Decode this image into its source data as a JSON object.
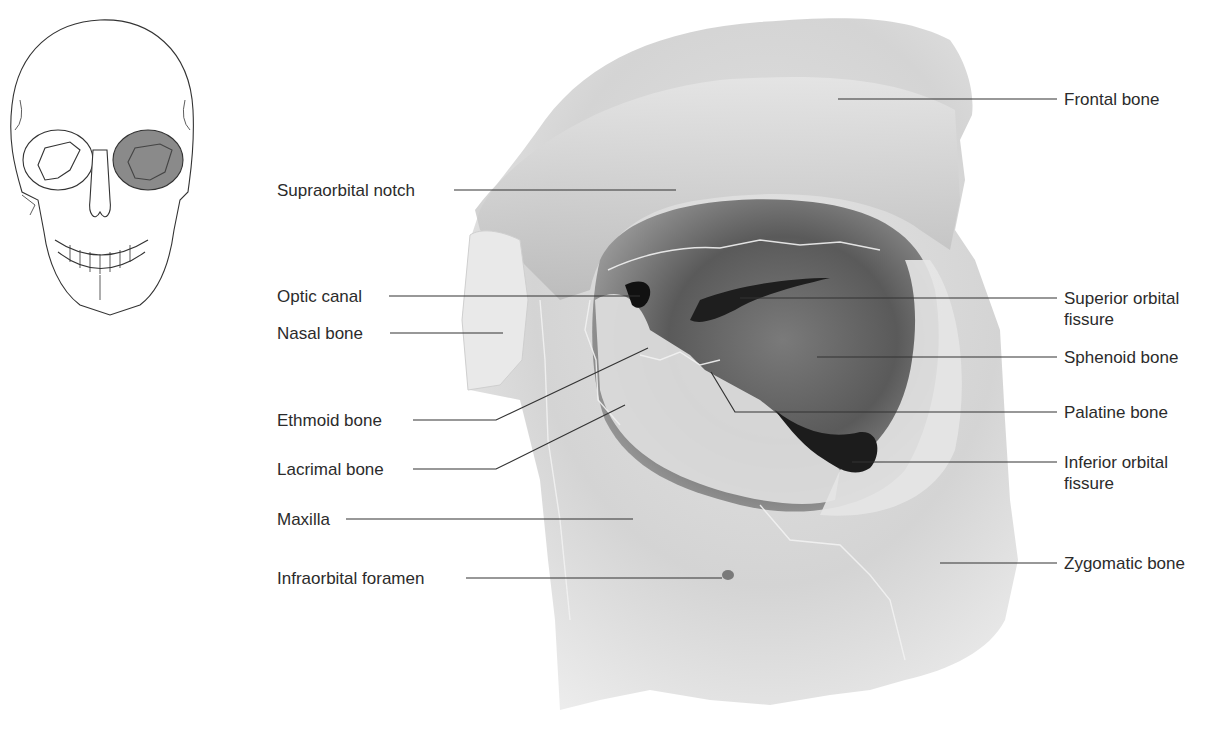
{
  "figure": {
    "locator": {
      "description": "Frontal view of skull with left orbit shaded",
      "highlight_color": "#7a7a7a"
    }
  },
  "labels_left": [
    {
      "id": "supraorbital-notch",
      "text": "Supraorbital notch"
    },
    {
      "id": "optic-canal",
      "text": "Optic canal"
    },
    {
      "id": "nasal-bone",
      "text": "Nasal bone"
    },
    {
      "id": "ethmoid-bone",
      "text": "Ethmoid bone"
    },
    {
      "id": "lacrimal-bone",
      "text": "Lacrimal bone"
    },
    {
      "id": "maxilla",
      "text": "Maxilla"
    },
    {
      "id": "infraorbital-foramen",
      "text": "Infraorbital foramen"
    }
  ],
  "labels_right": [
    {
      "id": "frontal-bone",
      "text": "Frontal bone"
    },
    {
      "id": "superior-orbital-fissure",
      "text": "Superior orbital fissure"
    },
    {
      "id": "sphenoid-bone",
      "text": "Sphenoid bone"
    },
    {
      "id": "palatine-bone",
      "text": "Palatine bone"
    },
    {
      "id": "inferior-orbital-fissure",
      "text": "Inferior orbital fissure"
    },
    {
      "id": "zygomatic-bone",
      "text": "Zygomatic bone"
    }
  ],
  "colors": {
    "label_text": "#2b2b2b",
    "leader_line": "#333333",
    "bone_light": "#ededed",
    "bone_mid": "#c9c9c9",
    "bone_dark": "#8e8e8e",
    "fissure": "#1e1e1e"
  }
}
